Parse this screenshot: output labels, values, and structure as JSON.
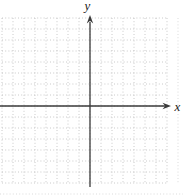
{
  "figure": {
    "kind": "empty coordinate plane with dotted grid",
    "x_axis_label": "x",
    "y_axis_label": "y"
  },
  "chart_data": {
    "type": "scatter",
    "title": "",
    "xlabel": "x",
    "ylabel": "y",
    "series": [],
    "xlim": [
      -8,
      7
    ],
    "ylim": [
      -7,
      8
    ],
    "grid": true,
    "grid_style": "dotted square grid, 1 unit per cell",
    "legend": false,
    "axes": "arrowheads on positive x (right) and positive y (up) ends only",
    "annotations": []
  },
  "colors": {
    "background": "#ffffff",
    "grid_line": "#bdbdbd",
    "axis": "#3a3a3a",
    "label": "#1a1a1a"
  }
}
